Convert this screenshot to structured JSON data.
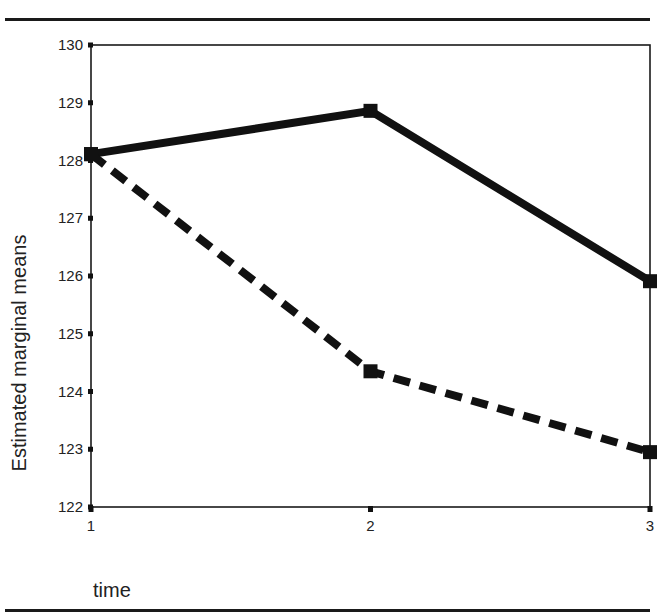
{
  "chart_data": {
    "type": "line",
    "title": "",
    "xlabel": "time",
    "ylabel": "Estimated marginal means",
    "categories": [
      "1",
      "2",
      "3"
    ],
    "x": [
      1,
      2,
      3
    ],
    "series": [
      {
        "name": "solid",
        "line_style": "solid",
        "marker": "square",
        "values": [
          128.11,
          128.86,
          125.91
        ]
      },
      {
        "name": "dashed",
        "line_style": "dashed",
        "marker": "square",
        "values": [
          128.11,
          124.35,
          122.95
        ]
      }
    ],
    "ylim": [
      122,
      130
    ],
    "yticks": [
      122,
      123,
      124,
      125,
      126,
      127,
      128,
      129,
      130
    ],
    "xticks": [
      1,
      2,
      3
    ],
    "grid": false,
    "legend": null,
    "colors": {
      "line": "#111111",
      "frame": "#1a1a1a"
    }
  },
  "axis": {
    "ylabel": "Estimated marginal means",
    "xlabel": "time",
    "yticks": [
      "122",
      "123",
      "124",
      "125",
      "126",
      "127",
      "128",
      "129",
      "130"
    ],
    "xticks": [
      "1",
      "2",
      "3"
    ]
  }
}
